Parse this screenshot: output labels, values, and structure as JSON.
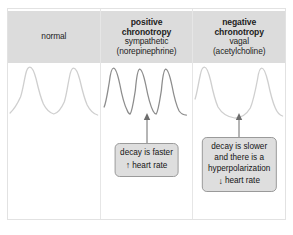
{
  "figure": {
    "background_color": "#ffffff",
    "border_color": "#e2e2e2",
    "header_fill": "#dcdcdc",
    "callout_fill": "#dedede",
    "callout_border": "#9a9a9a",
    "trace_color_light": "#cfcfcf",
    "trace_color_dark": "#8d8d8d"
  },
  "columns": [
    {
      "id": "normal",
      "header": {
        "line1": "normal",
        "line1_bold": false,
        "line2": "",
        "line3": "",
        "line4": ""
      },
      "trace": {
        "style": "light",
        "beats": 2,
        "description": "baseline pacemaker action potentials"
      },
      "callout": null
    },
    {
      "id": "positive-chronotropy",
      "header": {
        "line1": "positive",
        "line1_bold": true,
        "line2": "chronotropy",
        "line2_bold": true,
        "line3": "sympathetic",
        "line4": "(norepinephrine)"
      },
      "trace": {
        "style": "dark",
        "beats": 3,
        "description": "faster, more frequent action potentials"
      },
      "callout": {
        "lines": [
          "decay is faster"
        ],
        "arrow": "↑",
        "arrow_direction": "up",
        "rate_label": "heart rate"
      }
    },
    {
      "id": "negative-chronotropy",
      "header": {
        "line1": "negative",
        "line1_bold": true,
        "line2": "chronotropy",
        "line2_bold": true,
        "line3": "vagal",
        "line4": "(acetylcholine)"
      },
      "trace": {
        "style": "light",
        "beats": 2,
        "description": "slower action potentials with hyperpolarization"
      },
      "callout": {
        "lines": [
          "decay is slower",
          "and there is a",
          "hyperpolarization"
        ],
        "arrow": "↓",
        "arrow_direction": "down",
        "rate_label": "heart rate"
      }
    }
  ]
}
